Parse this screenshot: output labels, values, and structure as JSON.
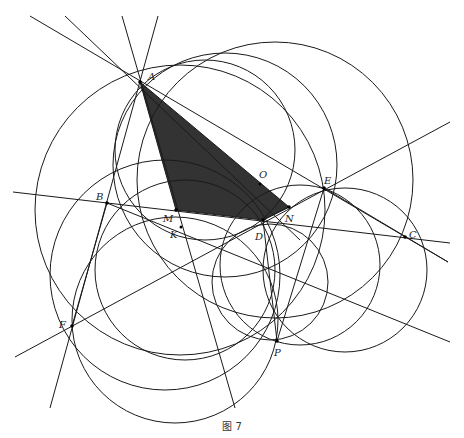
{
  "caption": "图 7",
  "points": {
    "A": {
      "label": "A",
      "x": 140,
      "y": 82
    },
    "B": {
      "label": "B",
      "x": 107,
      "y": 203
    },
    "C": {
      "label": "C",
      "x": 405,
      "y": 237
    },
    "D": {
      "label": "D",
      "x": 263,
      "y": 220
    },
    "E": {
      "label": "E",
      "x": 324,
      "y": 188
    },
    "F": {
      "label": "F",
      "x": 72,
      "y": 326
    },
    "P": {
      "label": "P",
      "x": 277,
      "y": 341
    },
    "M": {
      "label": "M",
      "x": 176,
      "y": 210
    },
    "N": {
      "label": "N",
      "x": 289,
      "y": 207
    },
    "O": {
      "label": "O",
      "x": 260,
      "y": 184
    },
    "K": {
      "label": "K",
      "x": 181,
      "y": 227
    }
  },
  "shaded_polygon": [
    "A",
    "M",
    "D",
    "N"
  ],
  "colors": {
    "stroke": "#1a1a1a",
    "shade": "#333333",
    "background": "#ffffff"
  }
}
